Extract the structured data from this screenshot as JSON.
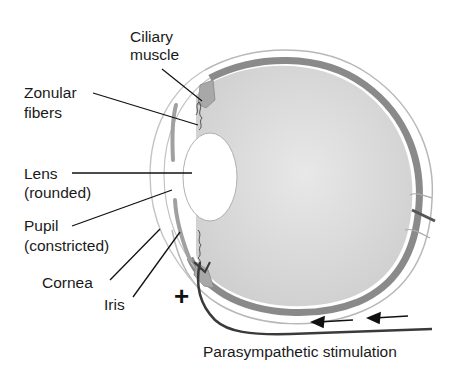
{
  "labels": {
    "ciliary_line1": "Ciliary",
    "ciliary_line2": "muscle",
    "zonular_line1": "Zonular",
    "zonular_line2": "fibers",
    "lens_line1": "Lens",
    "lens_line2": "(rounded)",
    "pupil_line1": "Pupil",
    "pupil_line2": "(constricted)",
    "cornea": "Cornea",
    "iris": "Iris",
    "stimulation": "Parasympathetic stimulation",
    "plus_sign": "+"
  },
  "colors": {
    "eyeball_fill": "#d8d8d8",
    "choroid": "#8a8a8a",
    "outline": "#bdbdbd",
    "nerve": "#3a3a3a",
    "text": "#1a1a1a"
  }
}
